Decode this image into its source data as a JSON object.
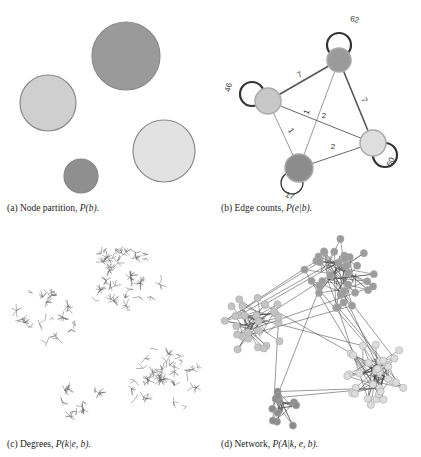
{
  "figure": {
    "panels": [
      {
        "id": "a",
        "caption_prefix": "(a) Node partition, ",
        "caption_math": "P(b).",
        "circles": [
          {
            "cx": 126,
            "cy": 56,
            "r": 34,
            "fill": "#9a9a9a",
            "stroke": "#8a8a8a"
          },
          {
            "cx": 48,
            "cy": 103,
            "r": 28,
            "fill": "#cfcfcf",
            "stroke": "#8a8a8a"
          },
          {
            "cx": 164,
            "cy": 151,
            "r": 31,
            "fill": "#e2e2e2",
            "stroke": "#8a8a8a"
          },
          {
            "cx": 81,
            "cy": 176,
            "r": 17,
            "fill": "#8f8f8f",
            "stroke": "#888888"
          }
        ]
      },
      {
        "id": "b",
        "caption_prefix": "(b) Edge counts, ",
        "caption_math": "P(e|b).",
        "nodes": [
          {
            "name": "top",
            "cx": 339,
            "cy": 60,
            "r": 12,
            "fill": "#9a9a9a",
            "self_loop": "62"
          },
          {
            "name": "left",
            "cx": 268,
            "cy": 101,
            "r": 13,
            "fill": "#c8c8c8",
            "self_loop": "46"
          },
          {
            "name": "right",
            "cx": 373,
            "cy": 143,
            "r": 13,
            "fill": "#dedede",
            "self_loop": "60"
          },
          {
            "name": "bottom",
            "cx": 299,
            "cy": 168,
            "r": 14,
            "fill": "#8c8c8c",
            "self_loop": "17"
          }
        ],
        "edges": [
          {
            "from": "top",
            "to": "left",
            "label": "7",
            "width": 1.6
          },
          {
            "from": "top",
            "to": "right",
            "label": "7",
            "width": 1.6
          },
          {
            "from": "top",
            "to": "bottom",
            "label": "1",
            "width": 0.6
          },
          {
            "from": "left",
            "to": "right",
            "label": "2",
            "width": 0.9
          },
          {
            "from": "left",
            "to": "bottom",
            "label": "1",
            "width": 0.6
          },
          {
            "from": "bottom",
            "to": "right",
            "label": "2",
            "width": 0.9
          }
        ]
      },
      {
        "id": "c",
        "caption_prefix": "(c) Degrees, ",
        "caption_math": "P(k|e, b)."
      },
      {
        "id": "d",
        "caption_prefix": "(d) Network, ",
        "caption_math": "P(A|k, e, b)."
      }
    ],
    "colors": {
      "dark_group": "#8f8f8f",
      "light_group": "#d6d6d6",
      "edge": "#555555",
      "loop": "#333333"
    }
  }
}
